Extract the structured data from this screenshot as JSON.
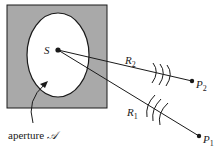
{
  "diagram": {
    "type": "aperture-diffraction-geometry",
    "colors": {
      "screen_fill": "#a9a9a9",
      "aperture_fill": "#ffffff",
      "ink": "#1a1a1a"
    },
    "source": {
      "label": "S"
    },
    "aperture": {
      "label_prefix": "aperture ",
      "label_symbol": "𝒜"
    },
    "rays": [
      {
        "label": "R",
        "subscript": "2",
        "target": {
          "label": "P",
          "subscript": "2"
        }
      },
      {
        "label": "R",
        "subscript": "1",
        "target": {
          "label": "P",
          "subscript": "1"
        }
      }
    ]
  }
}
